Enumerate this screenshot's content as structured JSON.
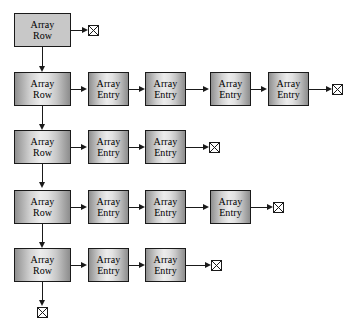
{
  "diagram": {
    "node_labels": {
      "row_line1": "Array",
      "row_line2": "Row",
      "entry_line1": "Array",
      "entry_line2": "Entry"
    },
    "colors": {
      "stroke": "#1a1a1a",
      "flat_fill": "#c8c8c8",
      "gradient_light": "#ececec",
      "gradient_dark": "#8d8d8d",
      "background": "#ffffff"
    },
    "rows": [
      {
        "id": "row-1",
        "row_node": {
          "label_line1": "Array",
          "label_line2": "Row",
          "style": "flat"
        },
        "entries": [],
        "terminator": true
      },
      {
        "id": "row-2",
        "row_node": {
          "label_line1": "Array",
          "label_line2": "Row",
          "style": "gradient"
        },
        "entries": [
          {
            "label_line1": "Array",
            "label_line2": "Entry"
          },
          {
            "label_line1": "Array",
            "label_line2": "Entry"
          },
          {
            "label_line1": "Array",
            "label_line2": "Entry"
          },
          {
            "label_line1": "Array",
            "label_line2": "Entry"
          }
        ],
        "terminator": true
      },
      {
        "id": "row-3",
        "row_node": {
          "label_line1": "Array",
          "label_line2": "Row",
          "style": "gradient"
        },
        "entries": [
          {
            "label_line1": "Array",
            "label_line2": "Entry"
          },
          {
            "label_line1": "Array",
            "label_line2": "Entry"
          }
        ],
        "terminator": true
      },
      {
        "id": "row-4",
        "row_node": {
          "label_line1": "Array",
          "label_line2": "Row",
          "style": "gradient"
        },
        "entries": [
          {
            "label_line1": "Array",
            "label_line2": "Entry"
          },
          {
            "label_line1": "Array",
            "label_line2": "Entry"
          },
          {
            "label_line1": "Array",
            "label_line2": "Entry"
          }
        ],
        "terminator": true
      },
      {
        "id": "row-5",
        "row_node": {
          "label_line1": "Array",
          "label_line2": "Row",
          "style": "gradient"
        },
        "entries": [
          {
            "label_line1": "Array",
            "label_line2": "Entry"
          },
          {
            "label_line1": "Array",
            "label_line2": "Entry"
          }
        ],
        "terminator": true,
        "tail_terminator": true
      }
    ],
    "icons": {
      "terminator": "null-terminator-icon",
      "arrow_right": "arrow-right-icon",
      "arrow_down": "arrow-down-icon"
    }
  }
}
